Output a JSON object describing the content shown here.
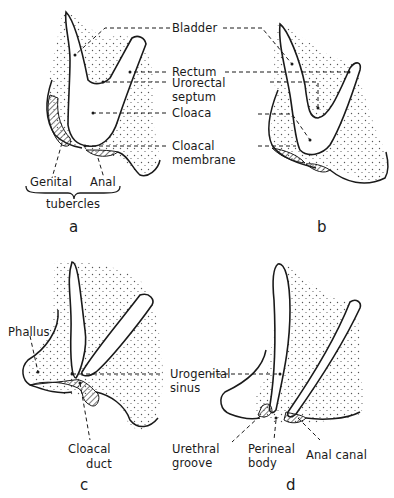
{
  "figure": {
    "type": "embryology-diagram",
    "colors": {
      "outline": "#1a1a1a",
      "stipple": "#4a4a4a",
      "background": "#ffffff"
    },
    "panels": [
      {
        "letter": "a",
        "labels": [
          "Genital",
          "Anal",
          "tubercles"
        ]
      },
      {
        "letter": "b",
        "labels": []
      },
      {
        "letter": "c",
        "labels": [
          "Phallus",
          "Cloacal",
          "duct"
        ]
      },
      {
        "letter": "d",
        "labels": [
          "Urethral",
          "groove",
          "Perineal",
          "body",
          "Anal canal"
        ]
      }
    ],
    "shared_labels_ab": [
      "Bladder",
      "Rectum",
      "Urorectal",
      "septum",
      "Cloaca",
      "Cloacal",
      "membrane"
    ],
    "shared_labels_cd": [
      "Urogenital",
      "sinus"
    ]
  }
}
